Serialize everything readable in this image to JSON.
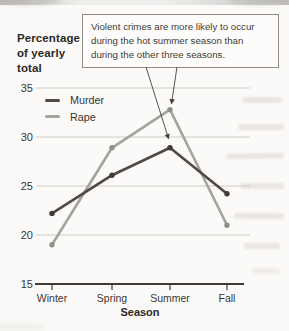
{
  "title": {
    "text": "Percentage of yearly total",
    "lines": [
      "Percentage",
      "of yearly",
      "total"
    ]
  },
  "callout": {
    "text": "Violent crimes are more likely to occur during the hot summer season than during the other three seasons."
  },
  "chart_data": {
    "type": "line",
    "categories": [
      "Winter",
      "Spring",
      "Summer",
      "Fall"
    ],
    "series": [
      {
        "name": "Murder",
        "values": [
          22.2,
          26.1,
          28.9,
          24.2
        ],
        "color": "#524844",
        "dot_color": "#443b38"
      },
      {
        "name": "Rape",
        "values": [
          19.0,
          28.9,
          32.8,
          21.0
        ],
        "color": "#a4a49e",
        "dot_color": "#8e8f88"
      }
    ],
    "ylabel": "Percentage of yearly total",
    "xlabel": "Season",
    "yticks": [
      15,
      20,
      25,
      30,
      35
    ],
    "ylim": [
      15,
      35
    ],
    "grid": true,
    "legend_position": "upper-left",
    "annotation": {
      "text": "Violent crimes are more likely to occur during the hot summer season than during the other three seasons.",
      "targets": [
        "Rape summer peak",
        "Murder summer peak"
      ]
    }
  },
  "colors": {
    "murder_line": "#524844",
    "rape_line": "#a4a49e",
    "gridline": "#cdccc8",
    "axis": "#3d3a37",
    "arrow": "#45423e",
    "background": "#fbfaf8"
  }
}
